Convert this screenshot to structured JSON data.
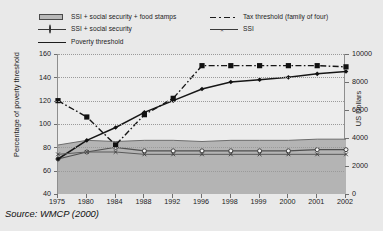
{
  "legend": {
    "entries": [
      {
        "label": "SSI + social security + food stamps",
        "key": "area-swatch"
      },
      {
        "label": "SSI + social security",
        "key": "line-open-circle"
      },
      {
        "label": "Poverty threshold",
        "key": "line-filled-diamond"
      },
      {
        "label": "Tax threshold (family of four)",
        "key": "dashdot-filled-square"
      },
      {
        "label": "SSI",
        "key": "line-x-marker"
      }
    ]
  },
  "source": "Source: WMCP (2000)",
  "chart_data": {
    "type": "line",
    "title": "",
    "xlabel": "",
    "ylabel": "Percentage of poverty threshold",
    "y2label": "US Dollars",
    "ylim": [
      40,
      160
    ],
    "yticks": [
      40,
      60,
      80,
      100,
      120,
      140,
      160
    ],
    "y2lim": [
      0,
      10000
    ],
    "y2ticks": [
      0,
      2000,
      4000,
      6000,
      8000,
      10000
    ],
    "grid": true,
    "legend_position": "top",
    "categories": [
      "1975",
      "1980",
      "1984",
      "1988",
      "1992",
      "1996",
      "1998",
      "1999",
      "2000",
      "2001",
      "2002"
    ],
    "series": [
      {
        "name": "SSI + social security + food stamps",
        "style": "area",
        "unit": "percent",
        "values": [
          82,
          86,
          85,
          86,
          86,
          85,
          86,
          86,
          86,
          87,
          87
        ]
      },
      {
        "name": "SSI + social security",
        "style": "line-open-circle",
        "unit": "percent",
        "values": [
          70,
          76,
          80,
          77,
          77,
          77,
          77,
          77,
          77,
          78,
          78
        ]
      },
      {
        "name": "Poverty threshold",
        "style": "line-filled-diamond",
        "unit": "percent",
        "values": [
          70,
          86,
          97,
          110,
          120,
          130,
          136,
          138,
          140,
          143,
          145
        ]
      },
      {
        "name": "Tax threshold (family of four)",
        "style": "dashdot-filled-square",
        "unit": "percent",
        "values": [
          120,
          106,
          82,
          108,
          122,
          150,
          150,
          150,
          150,
          150,
          149
        ]
      },
      {
        "name": "SSI",
        "style": "line-x-marker",
        "unit": "percent",
        "values": [
          74,
          76,
          76,
          74,
          74,
          74,
          74,
          74,
          74,
          74,
          74
        ]
      }
    ]
  }
}
